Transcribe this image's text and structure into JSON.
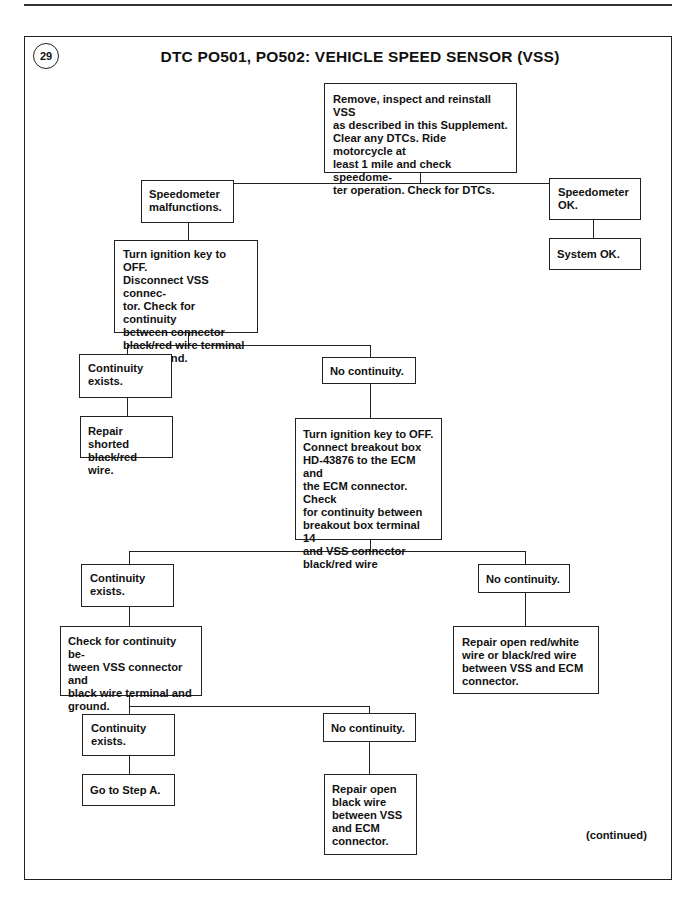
{
  "page": {
    "step_number": "29",
    "title": "DTC PO501, PO502: VEHICLE SPEED SENSOR (VSS)",
    "footer_note": "(continued)"
  },
  "flowchart": {
    "start": "Remove, inspect and reinstall VSS\nas described in this Supplement.\nClear any DTCs. Ride motorcycle at\nleast 1 mile and check speedome-\nter operation. Check for DTCs.",
    "speedo_malfunctions": "Speedometer\nmalfunctions.",
    "speedo_ok": "Speedometer\nOK.",
    "system_ok": "System OK.",
    "check_blackred_ground": "Turn ignition key to OFF.\nDisconnect VSS connec-\ntor. Check for continuity\nbetween connector\nblack/red wire terminal\nand ground.",
    "continuity_exists_1": "Continuity\nexists.",
    "no_continuity_1": "No continuity.",
    "repair_shorted": "Repair shorted\nblack/red wire.",
    "breakout_box_check": "Turn ignition key to OFF.\nConnect breakout box\nHD-43876 to the ECM and\nthe ECM connector. Check\nfor continuity between\nbreakout box terminal 14\nand VSS connector\nblack/red wire",
    "continuity_exists_2": "Continuity\nexists.",
    "no_continuity_2": "No continuity.",
    "check_black_ground": "Check for continuity be-\ntween VSS connector and\nblack wire terminal and\nground.",
    "repair_open_redwhite": "Repair open red/white\nwire or black/red wire\nbetween VSS and ECM\nconnector.",
    "continuity_exists_3": "Continuity\nexists.",
    "no_continuity_3": "No continuity.",
    "go_to_step_a": "Go to Step A.",
    "repair_open_black": "Repair open\nblack wire\nbetween VSS\nand ECM\nconnector."
  }
}
